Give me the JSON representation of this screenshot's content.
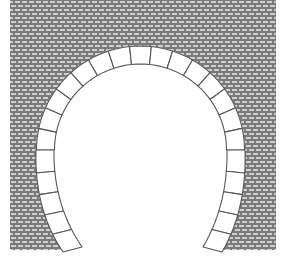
{
  "figure": {
    "title": "Horseshoe arch in brick wall",
    "colors": {
      "background": "#ffffff",
      "wall_fill": "#7a7a7a",
      "mortar": "#c8c8c8",
      "outline": "#555555",
      "voussoir_fill": "#ffffff"
    },
    "wall": {
      "x": 10,
      "y": 0,
      "width": 266,
      "height": 250,
      "brick_w": 7,
      "brick_h": 4
    },
    "arch": {
      "center_x": 140.5,
      "center_y": 150,
      "outer_radius": 104,
      "inner_radius": 86,
      "top_voussoirs": 14,
      "left_leg": {
        "outer_top": [
          36,
          150
        ],
        "inner_top": [
          54,
          150
        ],
        "outer_bottom": [
          63,
          252
        ],
        "inner_bottom": [
          82,
          247
        ]
      },
      "right_leg": {
        "outer_top": [
          245,
          150
        ],
        "inner_top": [
          227,
          150
        ],
        "outer_bottom": [
          222,
          252
        ],
        "inner_bottom": [
          203,
          247
        ]
      },
      "leg_blocks": 5
    }
  }
}
